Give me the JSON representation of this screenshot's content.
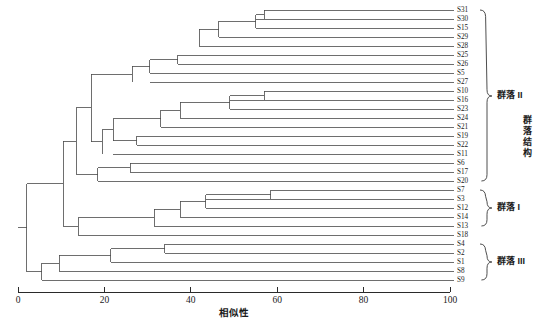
{
  "chart_data": {
    "type": "dendrogram",
    "title": "",
    "xlabel": "相似性",
    "ylabel": "",
    "xlim": [
      0,
      100
    ],
    "xticks": [
      0,
      20,
      40,
      60,
      80,
      100
    ],
    "xtick_labels": [
      "0",
      "20",
      "40",
      "60",
      "80",
      "100"
    ],
    "grid": false,
    "legend": "none",
    "orientation": "horizontal-right",
    "leaf_order": [
      "S31",
      "S30",
      "S15",
      "S29",
      "S28",
      "S25",
      "S26",
      "S5",
      "S27",
      "S10",
      "S16",
      "S23",
      "S24",
      "S21",
      "S19",
      "S22",
      "S11",
      "S6",
      "S17",
      "S20",
      "S7",
      "S3",
      "S12",
      "S14",
      "S13",
      "S18",
      "S4",
      "S2",
      "S1",
      "S8",
      "S9"
    ],
    "leaves": [
      {
        "label": "S31",
        "y": 10.0,
        "merge_similarity": 57.0
      },
      {
        "label": "S30",
        "y": 19.0,
        "merge_similarity": 55.0
      },
      {
        "label": "S15",
        "y": 28.0,
        "merge_similarity": 55.0
      },
      {
        "label": "S29",
        "y": 37.0,
        "merge_similarity": 46.5
      },
      {
        "label": "S28",
        "y": 46.0,
        "merge_similarity": 42.0
      },
      {
        "label": "S25",
        "y": 55.0,
        "merge_similarity": 37.0
      },
      {
        "label": "S26",
        "y": 64.0,
        "merge_similarity": 37.0
      },
      {
        "label": "S5",
        "y": 73.0,
        "merge_similarity": 30.5
      },
      {
        "label": "S27",
        "y": 82.0,
        "merge_similarity": 30.5
      },
      {
        "label": "S10",
        "y": 91.0,
        "merge_similarity": 57.0
      },
      {
        "label": "S16",
        "y": 100.0,
        "merge_similarity": 49.0
      },
      {
        "label": "S23",
        "y": 109.0,
        "merge_similarity": 49.0
      },
      {
        "label": "S24",
        "y": 118.0,
        "merge_similarity": 37.5
      },
      {
        "label": "S21",
        "y": 127.0,
        "merge_similarity": 33.0
      },
      {
        "label": "S19",
        "y": 136.0,
        "merge_similarity": 27.5
      },
      {
        "label": "S22",
        "y": 145.0,
        "merge_similarity": 27.5
      },
      {
        "label": "S11",
        "y": 154.0,
        "merge_similarity": 22.0
      },
      {
        "label": "S6",
        "y": 163.0,
        "merge_similarity": 26.0
      },
      {
        "label": "S17",
        "y": 172.0,
        "merge_similarity": 26.0
      },
      {
        "label": "S20",
        "y": 181.0,
        "merge_similarity": 18.5
      },
      {
        "label": "S7",
        "y": 190.0,
        "merge_similarity": 58.5
      },
      {
        "label": "S3",
        "y": 199.0,
        "merge_similarity": 43.5
      },
      {
        "label": "S12",
        "y": 208.0,
        "merge_similarity": 43.5
      },
      {
        "label": "S14",
        "y": 217.0,
        "merge_similarity": 37.5
      },
      {
        "label": "S13",
        "y": 226.0,
        "merge_similarity": 31.5
      },
      {
        "label": "S18",
        "y": 235.0,
        "merge_similarity": 14.0
      },
      {
        "label": "S4",
        "y": 244.0,
        "merge_similarity": 34.0
      },
      {
        "label": "S2",
        "y": 253.0,
        "merge_similarity": 34.0
      },
      {
        "label": "S1",
        "y": 262.0,
        "merge_similarity": 21.5
      },
      {
        "label": "S8",
        "y": 271.0,
        "merge_similarity": 9.5
      },
      {
        "label": "S9",
        "y": 280.0,
        "merge_similarity": 5.5
      }
    ],
    "clusters": [
      {
        "id": "c1",
        "similarity": 57.0,
        "children_y": [
          10.0,
          19.0
        ],
        "y": 14.5
      },
      {
        "id": "c2",
        "similarity": 55.0,
        "children_y": [
          14.5,
          28.0
        ],
        "y": 21.25
      },
      {
        "id": "c3",
        "similarity": 46.5,
        "children_y": [
          21.25,
          37.0
        ],
        "y": 29.1
      },
      {
        "id": "c4",
        "similarity": 42.0,
        "children_y": [
          29.1,
          46.0
        ],
        "y": 37.6
      },
      {
        "id": "c5",
        "similarity": 37.0,
        "children_y": [
          55.0,
          64.0
        ],
        "y": 59.5
      },
      {
        "id": "c6",
        "similarity": 30.5,
        "children_y": [
          59.5,
          73.0
        ],
        "y": 66.3
      },
      {
        "id": "c7",
        "similarity": 26.5,
        "children_y": [
          66.3,
          82.0
        ],
        "y": 74.1
      },
      {
        "id": "c8",
        "similarity": 57.0,
        "children_y": [
          91.0,
          100.0
        ],
        "y": 95.5
      },
      {
        "id": "c9",
        "similarity": 49.0,
        "children_y": [
          95.5,
          109.0
        ],
        "y": 102.2
      },
      {
        "id": "c10",
        "similarity": 37.5,
        "children_y": [
          102.2,
          118.0
        ],
        "y": 110.1
      },
      {
        "id": "c11",
        "similarity": 33.0,
        "children_y": [
          110.1,
          127.0
        ],
        "y": 118.5
      },
      {
        "id": "c12",
        "similarity": 27.5,
        "children_y": [
          136.0,
          145.0
        ],
        "y": 140.5
      },
      {
        "id": "c13",
        "similarity": 22.0,
        "children_y": [
          118.5,
          140.5
        ],
        "y": 129.5
      },
      {
        "id": "c14",
        "similarity": 19.5,
        "children_y": [
          129.5,
          154.0
        ],
        "y": 141.7
      },
      {
        "id": "c15",
        "similarity": 17.0,
        "children_y": [
          74.1,
          141.7
        ],
        "y": 107.9
      },
      {
        "id": "c16",
        "similarity": 26.0,
        "children_y": [
          163.0,
          172.0
        ],
        "y": 167.5
      },
      {
        "id": "c17",
        "similarity": 18.5,
        "children_y": [
          167.5,
          181.0
        ],
        "y": 174.2
      },
      {
        "id": "c18",
        "similarity": 13.5,
        "children_y": [
          107.9,
          174.2
        ],
        "y": 141.0
      },
      {
        "id": "c19",
        "similarity": 58.5,
        "children_y": [
          190.0,
          199.0
        ],
        "y": 194.5
      },
      {
        "id": "c20",
        "similarity": 43.5,
        "children_y": [
          194.5,
          208.0
        ],
        "y": 201.2
      },
      {
        "id": "c21",
        "similarity": 37.5,
        "children_y": [
          201.2,
          217.0
        ],
        "y": 209.1
      },
      {
        "id": "c22",
        "similarity": 31.5,
        "children_y": [
          209.1,
          226.0
        ],
        "y": 217.5
      },
      {
        "id": "c23",
        "similarity": 14.0,
        "children_y": [
          217.5,
          235.0
        ],
        "y": 226.2
      },
      {
        "id": "c24",
        "similarity": 10.5,
        "children_y": [
          141.0,
          226.2
        ],
        "y": 183.6
      },
      {
        "id": "c25",
        "similarity": 34.0,
        "children_y": [
          244.0,
          253.0
        ],
        "y": 248.5
      },
      {
        "id": "c26",
        "similarity": 21.5,
        "children_y": [
          248.5,
          262.0
        ],
        "y": 255.2
      },
      {
        "id": "c27",
        "similarity": 9.5,
        "children_y": [
          255.2,
          271.0
        ],
        "y": 263.1
      },
      {
        "id": "c28",
        "similarity": 5.5,
        "children_y": [
          263.1,
          280.0
        ],
        "y": 271.5
      },
      {
        "id": "c29",
        "similarity": 2.0,
        "children_y": [
          183.6,
          271.5
        ],
        "y": 227.5
      }
    ],
    "groups": [
      {
        "name": "群落 II",
        "label": "群落 II",
        "from_y": 10.0,
        "to_y": 181.0,
        "label_y": 96.0
      },
      {
        "name": "群落 I",
        "label": "群落 I",
        "from_y": 190.0,
        "to_y": 226.0,
        "label_y": 208.0
      },
      {
        "name": "群落 III",
        "label": "群落 III",
        "from_y": 244.0,
        "to_y": 280.0,
        "label_y": 262.0
      }
    ],
    "side_annotation": {
      "text": "群落结构",
      "chars": [
        "群",
        "落",
        "结",
        "构"
      ],
      "orientation": "vertical"
    }
  },
  "axis": {
    "title": "相似性",
    "tick_labels": [
      "0",
      "20",
      "40",
      "60",
      "80",
      "100"
    ]
  },
  "colors": {
    "line": "#4a4a4a",
    "axis": "#2a2a2a",
    "text": "#1a1a1a",
    "background": "#ffffff"
  }
}
